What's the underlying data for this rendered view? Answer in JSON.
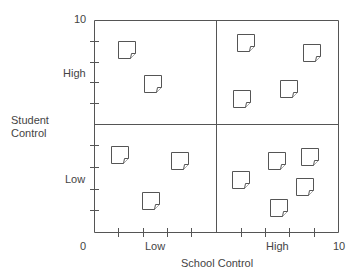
{
  "diagram": {
    "type": "quadrant-matrix",
    "x_axis": {
      "title": "School Control",
      "min_label": "0",
      "max_label": "10",
      "low_label": "Low",
      "high_label": "High"
    },
    "y_axis": {
      "title_line1": "Student",
      "title_line2": "Control",
      "max_label": "10",
      "low_label": "Low",
      "high_label": "High"
    },
    "quadrants": [
      {
        "name": "high-student-low-school",
        "note_count": 2
      },
      {
        "name": "high-student-high-school",
        "note_count": 4
      },
      {
        "name": "low-student-low-school",
        "note_count": 3
      },
      {
        "name": "low-student-high-school",
        "note_count": 5
      }
    ],
    "icon": "sticky-note-icon",
    "line_color": "#555555"
  }
}
